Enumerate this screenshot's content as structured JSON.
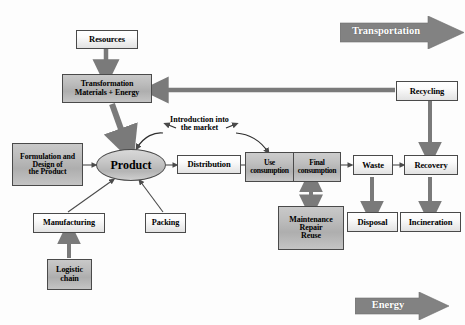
{
  "diagram": {
    "colors": {
      "arrow_gray": "#7a7a7a",
      "arrow_thin": "#5a5a5a",
      "banner_gray": "#828282",
      "box_border": "#4a4a4a",
      "box_light": "#ffffff",
      "box_gray": "#bdbdbd",
      "text": "#000000",
      "banner_text": "#ffffff"
    },
    "banners": [
      {
        "id": "transportation",
        "label": "Transportation",
        "direction": "right"
      },
      {
        "id": "energy",
        "label": "Energy",
        "direction": "right"
      }
    ],
    "nodes": [
      {
        "id": "resources",
        "label": "Resources",
        "shape": "box",
        "fill": "light"
      },
      {
        "id": "transformation",
        "label": "Transformation\nMaterials + Energy",
        "line1": "Transformation",
        "line2": "Materials + Energy",
        "shape": "box",
        "fill": "gray"
      },
      {
        "id": "formulation",
        "label": "Formulation and Design of the Product",
        "line1": "Formulation and",
        "line2": "Design of",
        "line3": "the Product",
        "shape": "box",
        "fill": "gray"
      },
      {
        "id": "product",
        "label": "Product",
        "shape": "ellipse",
        "fill": "gray"
      },
      {
        "id": "manufacturing",
        "label": "Manufacturing",
        "shape": "box",
        "fill": "light"
      },
      {
        "id": "logistic_chain",
        "label": "Logistic chain",
        "line1": "Logistic",
        "line2": "chain",
        "shape": "box",
        "fill": "gray"
      },
      {
        "id": "packing",
        "label": "Packing",
        "shape": "box",
        "fill": "light"
      },
      {
        "id": "distribution",
        "label": "Distribution",
        "shape": "box",
        "fill": "light"
      },
      {
        "id": "use_consumption",
        "label": "Use consumption",
        "line1": "Use",
        "line2": "consumption",
        "shape": "box",
        "fill": "gray"
      },
      {
        "id": "final_consumption",
        "label": "Final consumption",
        "line1": "Final",
        "line2": "consumption",
        "shape": "box",
        "fill": "gray"
      },
      {
        "id": "maintenance",
        "label": "Maintenance Repair Reuse",
        "line1": "Maintenance",
        "line2": "Repair",
        "line3": "Reuse",
        "shape": "box",
        "fill": "gray"
      },
      {
        "id": "waste",
        "label": "Waste",
        "shape": "box",
        "fill": "light"
      },
      {
        "id": "recovery",
        "label": "Recovery",
        "shape": "box",
        "fill": "light"
      },
      {
        "id": "disposal",
        "label": "Disposal",
        "shape": "box",
        "fill": "light"
      },
      {
        "id": "incineration",
        "label": "Incineration",
        "shape": "box",
        "fill": "light"
      },
      {
        "id": "recycling",
        "label": "Recycling",
        "shape": "box",
        "fill": "light"
      }
    ],
    "free_labels": [
      {
        "id": "introduction_market",
        "line1": "Introduction into",
        "line2": "the market"
      }
    ],
    "edges": [
      {
        "from": "resources",
        "to": "transformation",
        "style": "thick-gray"
      },
      {
        "from": "transformation",
        "to": "product",
        "style": "thick-gray"
      },
      {
        "from": "recycling",
        "to": "transformation",
        "style": "thick-gray"
      },
      {
        "from": "formulation",
        "to": "product",
        "style": "thin"
      },
      {
        "from": "manufacturing",
        "to": "product",
        "style": "thin"
      },
      {
        "from": "packing",
        "to": "product",
        "style": "thin"
      },
      {
        "from": "logistic_chain",
        "to": "manufacturing",
        "style": "thick-gray"
      },
      {
        "from": "product",
        "to": "distribution",
        "style": "thin"
      },
      {
        "from": "distribution",
        "to": "use_consumption",
        "style": "thin"
      },
      {
        "from": "introduction_market",
        "to": "product",
        "style": "curved-double"
      },
      {
        "from": "introduction_market",
        "to": "use_consumption",
        "style": "curved-double"
      },
      {
        "from": "final_consumption",
        "to": "waste",
        "style": "thin"
      },
      {
        "from": "maintenance",
        "to": "final_consumption",
        "style": "double-gray"
      },
      {
        "from": "waste",
        "to": "recovery",
        "style": "thin"
      },
      {
        "from": "waste",
        "to": "disposal",
        "style": "thick-gray"
      },
      {
        "from": "recovery",
        "to": "incineration",
        "style": "thick-gray"
      },
      {
        "from": "recycling",
        "to": "recovery",
        "style": "thick-gray"
      }
    ]
  }
}
